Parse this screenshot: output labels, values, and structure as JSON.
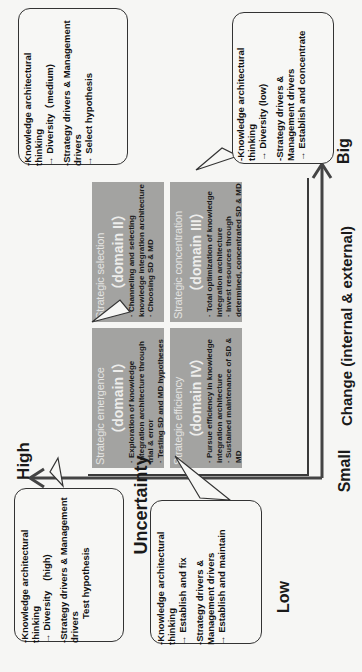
{
  "axes": {
    "vertical": {
      "name": "Change (internal & external)",
      "low_label": "Small",
      "high_label": "Big"
    },
    "horizontal": {
      "name": "Uncertainty",
      "high_label": "High",
      "low_label": "Low"
    }
  },
  "quadrants": [
    {
      "id": "domain-1",
      "title": "Strategic emergence",
      "domain": "（domain I）",
      "bullets": [
        "· Exploration of knowledge integration architecture through trial & error",
        "· Testing SD and MD hypotheses"
      ]
    },
    {
      "id": "domain-2",
      "title": "Strategic selection",
      "domain": "（domain II）",
      "bullets": [
        "· Channeling and selecting knowledge integration architecture",
        "· Choosing SD & MD"
      ]
    },
    {
      "id": "domain-3",
      "title": "Strategic concentration",
      "domain": "（domain III）",
      "bullets": [
        "· Total optimization of knowledge integration architecture",
        "· Invest resources through determined, concentrated SD & MD"
      ]
    },
    {
      "id": "domain-4",
      "title": "Strategic efficiency",
      "domain": "（domain IV）",
      "bullets": [
        "· Pursue efficiency in knowledge integration architecture",
        "· Sustained maintenance of SD & MD"
      ]
    }
  ],
  "callouts": [
    {
      "for": "domain-1",
      "line1": "-Knowledge architectural thinking",
      "line2": "→ Diversity　(high)",
      "line3": "-Strategy drivers & Management drivers",
      "line4": "Test hypothesis"
    },
    {
      "for": "domain-2",
      "line1": "-Knowledge architectural thinking",
      "line2": "→ Diversity（medium)",
      "line3": "-Strategy drivers & Management drivers",
      "line4": "→ Select hypothesis"
    },
    {
      "for": "domain-3",
      "line1": "-Knowledge architectural thinking",
      "line2": "→ Diversity (low)",
      "line3": "-Strategy drivers & Management drivers",
      "line4": "→ Establish and concentrate"
    },
    {
      "for": "domain-4",
      "line1": "-Knowledge architectural thinking",
      "line2": "→ Establish and fix",
      "line3": "-Strategy drivers & Management drivers",
      "line4": "→ Establish and maintain"
    }
  ],
  "colors": {
    "quadrant_fill": "#a3a3a1",
    "axis": "#444444",
    "background": "#f6f6f4"
  }
}
